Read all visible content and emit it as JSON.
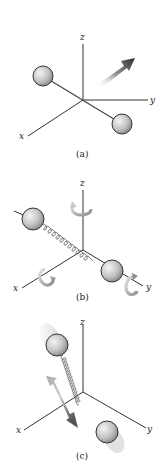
{
  "figure": {
    "panels": [
      {
        "id": "a",
        "caption": "(a)",
        "motion": "translation",
        "axes": {
          "x": "x",
          "y": "y",
          "z": "z"
        },
        "origin": [
          83,
          100
        ],
        "balls": [
          {
            "cx": 43,
            "cy": 76,
            "r": 10
          },
          {
            "cx": 122,
            "cy": 124,
            "r": 10
          }
        ],
        "bond": "rigid rod"
      },
      {
        "id": "b",
        "caption": "(b)",
        "motion": "rotation",
        "axes": {
          "x": "x",
          "y": "y",
          "z": "z"
        },
        "origin": [
          83,
          250
        ],
        "balls": [
          {
            "cx": 33,
            "cy": 219,
            "r": 11
          },
          {
            "cx": 112,
            "cy": 271,
            "r": 11
          }
        ],
        "bond": "spring",
        "rotation_arrows": [
          "about z",
          "about x",
          "about y"
        ]
      },
      {
        "id": "c",
        "caption": "(c)",
        "motion": "vibration",
        "axes": {
          "x": "x",
          "y": "y",
          "z": "z"
        },
        "origin": [
          83,
          392
        ],
        "balls": [
          {
            "cx": 57,
            "cy": 345,
            "r": 11
          },
          {
            "cx": 107,
            "cy": 432,
            "r": 11
          }
        ],
        "bond": "spring",
        "double_arrow": true
      }
    ],
    "colors": {
      "axis": "#333333",
      "ball_light": "#f2f2f2",
      "ball_dark": "#8a8a8a",
      "arrow_dark": "#2e2e2e",
      "arrow_light": "#d8d8d8"
    }
  }
}
